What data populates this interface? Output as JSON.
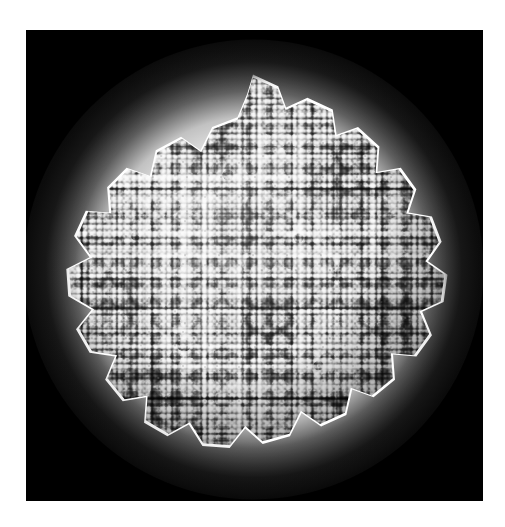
{
  "figure": {
    "domain": "Natural-Image",
    "kind": "scientific-micrograph-style-render",
    "representation": "space-filling atomic surface (CPK spheres)",
    "caption": "",
    "title": "",
    "label": "",
    "scale_bar": "",
    "annotations": []
  },
  "page": {
    "background_color": "#ffffff",
    "width_px": 505,
    "height_px": 527
  },
  "panel": {
    "background_color": "#000000",
    "left_px": 26,
    "top_px": 30,
    "width_px": 457,
    "height_px": 471
  },
  "capsid": {
    "center_x_px": 253,
    "center_y_px": 269,
    "diameter_px": 383,
    "silhouette": "polygonal with vertex spikes",
    "visible_spike_count": 14,
    "glow_color": "#ffffff",
    "highlight_color": "#e8e8e8",
    "midtone_color": "#8c8c8c",
    "shadow_color": "#2b2b2b",
    "light_direction": "upper-left",
    "features": [
      {
        "name": "pentamer-ring",
        "x_pct": 47,
        "y_pct": 28,
        "size_px": 34
      },
      {
        "name": "pentamer-ring",
        "x_pct": 66,
        "y_pct": 44,
        "size_px": 30
      },
      {
        "name": "pentamer-ring",
        "x_pct": 36,
        "y_pct": 73,
        "size_px": 38
      },
      {
        "name": "pentamer-ring",
        "x_pct": 70,
        "y_pct": 78,
        "size_px": 32
      },
      {
        "name": "pentamer-ring",
        "x_pct": 22,
        "y_pct": 44,
        "size_px": 26
      },
      {
        "name": "pentamer-ring",
        "x_pct": 82,
        "y_pct": 30,
        "size_px": 24
      }
    ]
  }
}
